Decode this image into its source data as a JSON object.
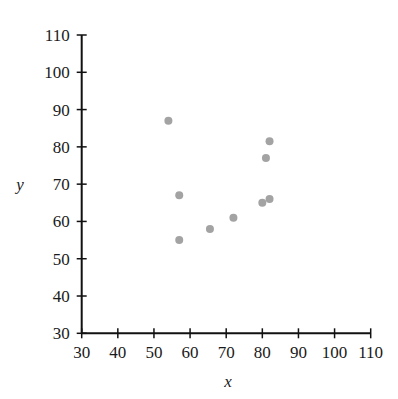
{
  "chart_data": {
    "type": "scatter",
    "title": "",
    "xlabel": "x",
    "ylabel": "y",
    "xlim": [
      30,
      110
    ],
    "ylim": [
      30,
      110
    ],
    "xticks": [
      30,
      40,
      50,
      60,
      70,
      80,
      90,
      100,
      110
    ],
    "yticks": [
      30,
      40,
      50,
      60,
      70,
      80,
      90,
      100,
      110
    ],
    "grid": false,
    "legend": null,
    "marker_color": "#a3a3a3",
    "points": [
      {
        "x": 54,
        "y": 87
      },
      {
        "x": 57,
        "y": 67
      },
      {
        "x": 57,
        "y": 55
      },
      {
        "x": 65.5,
        "y": 58
      },
      {
        "x": 72,
        "y": 61
      },
      {
        "x": 80,
        "y": 65
      },
      {
        "x": 81,
        "y": 77
      },
      {
        "x": 82,
        "y": 81.5
      },
      {
        "x": 82,
        "y": 66
      }
    ]
  },
  "labels": {
    "x": "x",
    "y": "y"
  }
}
